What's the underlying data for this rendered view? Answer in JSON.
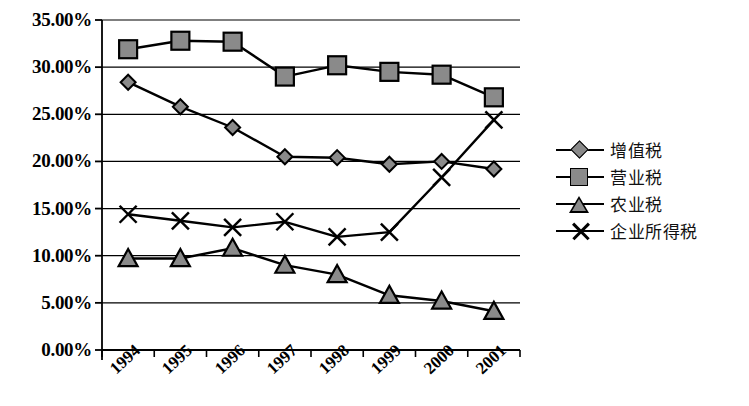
{
  "chart_data": {
    "type": "line",
    "title": "",
    "xlabel": "",
    "ylabel": "",
    "categories": [
      "1994",
      "1995",
      "1996",
      "1997",
      "1998",
      "1999",
      "2000",
      "2001"
    ],
    "ylim": [
      0,
      35
    ],
    "ytick_labels": [
      "0.00%",
      "5.00%",
      "10.00%",
      "15.00%",
      "20.00%",
      "25.00%",
      "30.00%",
      "35.00%"
    ],
    "ytick_values": [
      0,
      5,
      10,
      15,
      20,
      25,
      30,
      35
    ],
    "grid": true,
    "legend_position": "right",
    "series": [
      {
        "name": "增值税",
        "marker": "diamond",
        "values": [
          28.4,
          25.8,
          23.6,
          20.5,
          20.4,
          19.7,
          20.0,
          19.2
        ]
      },
      {
        "name": "营业税",
        "marker": "square",
        "values": [
          31.9,
          32.8,
          32.7,
          29.0,
          30.2,
          29.5,
          29.2,
          26.8
        ]
      },
      {
        "name": "农业税",
        "marker": "triangle",
        "values": [
          9.7,
          9.7,
          10.8,
          9.0,
          8.0,
          5.8,
          5.2,
          4.1
        ]
      },
      {
        "name": "企业所得税",
        "marker": "x",
        "values": [
          14.4,
          13.7,
          13.0,
          13.6,
          12.0,
          12.5,
          18.3,
          24.4
        ]
      }
    ],
    "colors": {
      "marker_fill": "#8a8a8a",
      "line": "#000000",
      "axis": "#000000",
      "grid": "#000000",
      "background": "#ffffff"
    }
  }
}
